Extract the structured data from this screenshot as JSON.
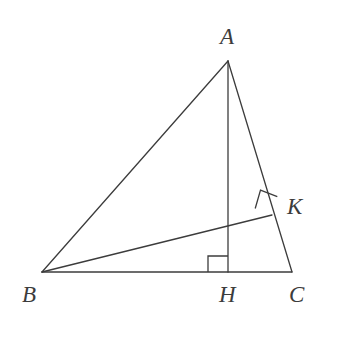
{
  "figure": {
    "kind": "geometry-diagram",
    "background_color": "#ffffff",
    "stroke_color": "#3c3c3c",
    "label_color": "#3c3c3c",
    "stroke_width": 1.3,
    "canvas": {
      "width": 338,
      "height": 339
    }
  },
  "points": {
    "A": {
      "label": "A",
      "x": 228,
      "y": 61
    },
    "B": {
      "label": "B",
      "x": 42,
      "y": 272
    },
    "C": {
      "label": "C",
      "x": 292,
      "y": 272
    },
    "H": {
      "label": "H",
      "x": 228,
      "y": 272
    },
    "K": {
      "label": "K",
      "x": 272,
      "y": 215
    }
  },
  "segments": [
    {
      "name": "AB",
      "from": "A",
      "to": "B",
      "x1": 228,
      "y1": 61,
      "x2": 42,
      "y2": 272
    },
    {
      "name": "AC",
      "from": "A",
      "to": "C",
      "x1": 228,
      "y1": 61,
      "x2": 292,
      "y2": 272
    },
    {
      "name": "BC",
      "from": "B",
      "to": "C",
      "x1": 42,
      "y1": 272,
      "x2": 292,
      "y2": 272
    },
    {
      "name": "AH",
      "from": "A",
      "to": "H",
      "x1": 228,
      "y1": 61,
      "x2": 228,
      "y2": 272
    },
    {
      "name": "BK",
      "from": "B",
      "to": "K",
      "x1": 42,
      "y1": 272,
      "x2": 272,
      "y2": 215
    }
  ],
  "right_angle_marks": [
    {
      "name": "right-angle-at-H",
      "at": "H",
      "points": "208,272 208,256 228,256"
    },
    {
      "name": "right-angle-at-K",
      "at": "K",
      "points": "255.2,208.5 260.5,190.1 277.3,196.6"
    }
  ]
}
